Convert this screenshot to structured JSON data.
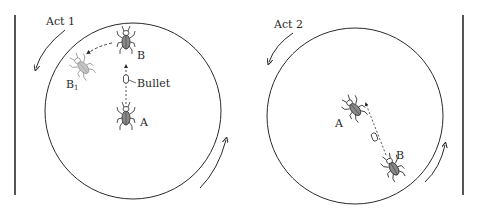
{
  "figure": {
    "panels": [
      {
        "id": "act1",
        "title": "Act 1",
        "beetles": [
          {
            "label": "A",
            "role": "shooter"
          },
          {
            "label": "B",
            "role": "target"
          },
          {
            "label": "B",
            "subscript": "1",
            "role": "target-after-impact"
          }
        ],
        "annotations": {
          "bullet": "Bullet"
        }
      },
      {
        "id": "act2",
        "title": "Act 2",
        "beetles": [
          {
            "label": "A",
            "role": "target"
          },
          {
            "label": "B",
            "role": "shooter"
          }
        ]
      }
    ],
    "colors": {
      "ink": "#2a2a2a",
      "background": "#ffffff",
      "beetle_fill": "#8a8a8a"
    }
  }
}
